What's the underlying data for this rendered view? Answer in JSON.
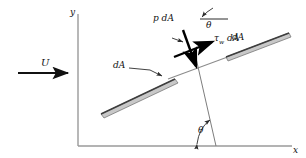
{
  "figure": {
    "background_color": "#ffffff",
    "width": 306,
    "height": 158
  },
  "axes": {
    "x_label": "x",
    "y_label": "y",
    "axis_color": "#9a9a9a",
    "origin": {
      "x": 78,
      "y": 146
    },
    "x_end": {
      "x": 292,
      "y": 146
    },
    "y_end": {
      "x": 78,
      "y": 14
    }
  },
  "freestream": {
    "label": "U",
    "arrow_color": "#111111",
    "start": {
      "x": 18,
      "y": 73
    },
    "end": {
      "x": 73,
      "y": 73
    }
  },
  "plate": {
    "fill_color": "#c9c9c9",
    "edge_color": "#4a4a4a",
    "left_segment": {
      "x1": 104,
      "y1": 110,
      "x2": 178,
      "y2": 75
    },
    "right_segment": {
      "x1": 225,
      "y1": 52,
      "x2": 288,
      "y2": 33
    },
    "surface_line_color": "#8c8c8c"
  },
  "forces": {
    "pressure": {
      "label": "p dA",
      "symbol": "p",
      "area": "dA",
      "color": "#000000",
      "direction": "normal-into-surface"
    },
    "shear": {
      "label_symbol": "τ",
      "label_subscript": "w",
      "label_area": "dA",
      "full_label": "τw dA",
      "color": "#000000",
      "direction": "tangential-along-surface"
    }
  },
  "annotations": {
    "da_left": "dA",
    "da_right": "dA",
    "theta_top": "θ",
    "theta_bottom": "θ",
    "leader_color": "#2b2b2b",
    "reference_line_color": "#2b2b2b",
    "normal_line_color": "#7d7d7d"
  }
}
